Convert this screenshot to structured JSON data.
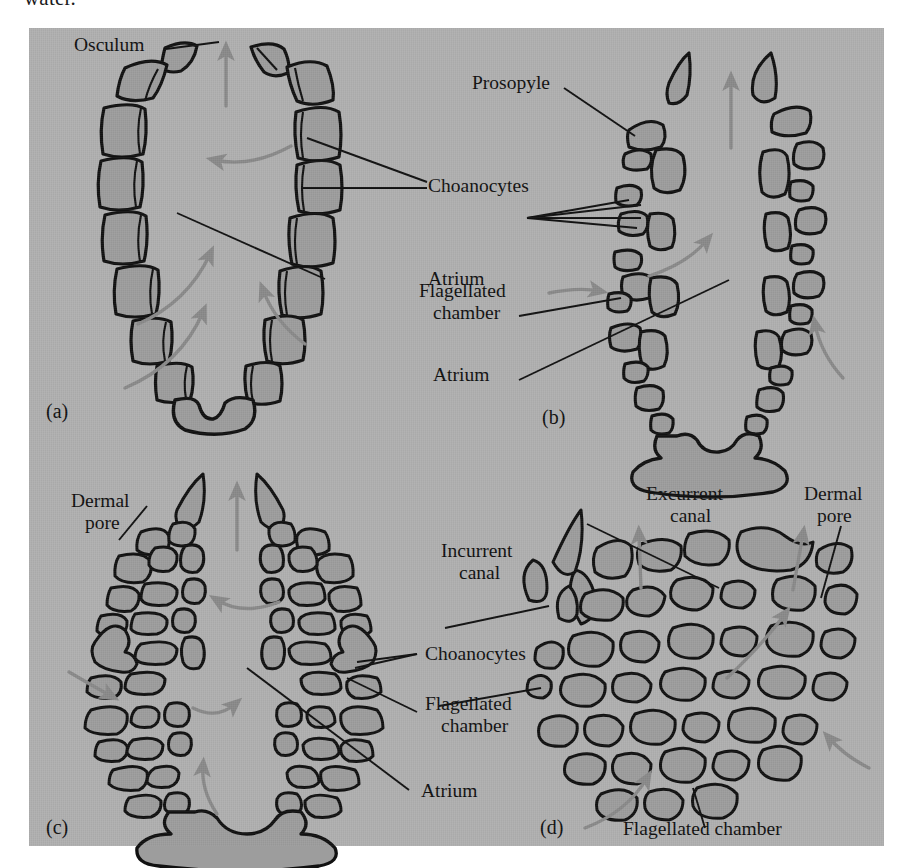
{
  "page": {
    "cropped_body_text": "water.",
    "background_color": "#ffffff",
    "plate_color": "#b0b0b0",
    "ink_color": "#101010",
    "cell_fill_color": "#9d9d9d",
    "flow_arrow_color": "#8a8a8a"
  },
  "figure": {
    "panels": [
      {
        "id": "(a)",
        "name": "asconoid",
        "labels": [
          {
            "key": "osculum",
            "text": "Osculum"
          },
          {
            "key": "choanocytes",
            "text": "Choanocytes"
          },
          {
            "key": "atrium",
            "text": "Atrium"
          }
        ]
      },
      {
        "id": "(b)",
        "name": "syconoid",
        "labels": [
          {
            "key": "prosopyle",
            "text": "Prosopyle"
          },
          {
            "key": "flagellated_chamber_line1",
            "text": "Flagellated"
          },
          {
            "key": "flagellated_chamber_line2",
            "text": "chamber"
          },
          {
            "key": "atrium",
            "text": "Atrium"
          }
        ]
      },
      {
        "id": "(c)",
        "name": "syconoid-with-cortex",
        "labels": [
          {
            "key": "dermal_pore_line1",
            "text": "Dermal"
          },
          {
            "key": "dermal_pore_line2",
            "text": "pore"
          },
          {
            "key": "choanocytes",
            "text": "Choanocytes"
          },
          {
            "key": "flagellated_chamber_line1",
            "text": "Flagellated"
          },
          {
            "key": "flagellated_chamber_line2",
            "text": "chamber"
          },
          {
            "key": "atrium",
            "text": "Atrium"
          }
        ]
      },
      {
        "id": "(d)",
        "name": "leuconoid",
        "labels": [
          {
            "key": "incurrent_canal_line1",
            "text": "Incurrent"
          },
          {
            "key": "incurrent_canal_line2",
            "text": "canal"
          },
          {
            "key": "excurrent_canal_line1",
            "text": "Excurrent"
          },
          {
            "key": "excurrent_canal_line2",
            "text": "canal"
          },
          {
            "key": "dermal_pore_line1",
            "text": "Dermal"
          },
          {
            "key": "dermal_pore_line2",
            "text": "pore"
          },
          {
            "key": "choanocytes",
            "text": "Choanocytes"
          },
          {
            "key": "flagellated_chamber_line1",
            "text": "Flagellated"
          },
          {
            "key": "flagellated_chamber_line2",
            "text": "chamber"
          },
          {
            "key": "flagellated_chamber_bottom",
            "text": "Flagellated chamber"
          }
        ]
      }
    ],
    "shared_labels": {
      "choanocytes": "Choanocytes",
      "atrium": "Atrium",
      "flagellated_chamber": "Flagellated chamber",
      "dermal_pore": "Dermal pore",
      "osculum": "Osculum",
      "prosopyle": "Prosopyle",
      "incurrent_canal": "Incurrent canal",
      "excurrent_canal": "Excurrent canal"
    }
  }
}
